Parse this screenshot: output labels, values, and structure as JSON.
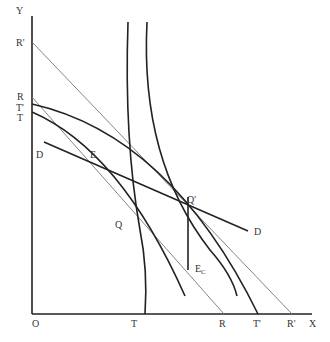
{
  "diagram": {
    "axes": {
      "y_label": "Y",
      "x_label": "X",
      "origin_label": "O"
    },
    "y_axis_labels": [
      "R'",
      "R",
      "T'",
      "T"
    ],
    "x_axis_labels": [
      "T",
      "R",
      "T'",
      "R'"
    ],
    "points": {
      "E": "E",
      "Q": "Q",
      "Q_prime": "Q'",
      "E_c_main": "E",
      "E_c_sub": "C",
      "D_left": "D",
      "D_right": "D"
    },
    "colors": {
      "thick_line": "#222222",
      "thin_line": "#777777",
      "label": "#333333"
    }
  }
}
